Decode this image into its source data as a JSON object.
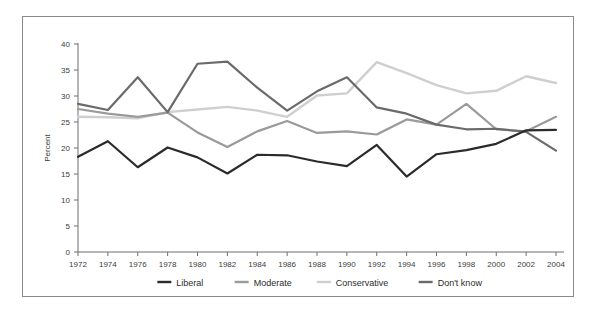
{
  "chart_data": {
    "type": "line",
    "title": "",
    "subtitle": "",
    "xlabel": "",
    "ylabel": "Percent",
    "xlim": [
      1972,
      2004
    ],
    "ylim": [
      0,
      40
    ],
    "ytick_step": 5,
    "xtick_step": 2,
    "grid": false,
    "legend_position": "bottom",
    "x": [
      1972,
      1974,
      1976,
      1978,
      1980,
      1982,
      1984,
      1986,
      1988,
      1990,
      1992,
      1994,
      1996,
      1998,
      2000,
      2002,
      2004
    ],
    "xticklabels": [
      "1972",
      "1974",
      "1976",
      "1978",
      "1980",
      "1982",
      "1984",
      "1986",
      "1988",
      "1990",
      "1992",
      "1994",
      "1996",
      "1998",
      "2000",
      "2002",
      "2004"
    ],
    "yticklabels": [
      "0",
      "5",
      "10",
      "15",
      "20",
      "25",
      "30",
      "35",
      "40"
    ],
    "yticks": [
      0,
      5,
      10,
      15,
      20,
      25,
      30,
      35,
      40
    ],
    "series": [
      {
        "name": "Liberal",
        "color": "#2b2b2b",
        "width": 2.2,
        "values": [
          18.3,
          21.3,
          16.3,
          20.1,
          18.2,
          15.1,
          18.7,
          18.6,
          17.4,
          16.5,
          20.6,
          14.5,
          18.8,
          19.6,
          20.8,
          23.4,
          23.5
        ]
      },
      {
        "name": "Moderate",
        "color": "#9a9a9a",
        "width": 2.2,
        "values": [
          27.5,
          26.6,
          26.0,
          26.8,
          23.0,
          20.2,
          23.2,
          25.2,
          22.9,
          23.2,
          22.6,
          25.5,
          24.5,
          28.5,
          23.6,
          23.2,
          26.0
        ]
      },
      {
        "name": "Conservative",
        "color": "#cfcfcf",
        "width": 2.4,
        "values": [
          26.0,
          25.9,
          25.7,
          26.9,
          27.4,
          27.9,
          27.2,
          26.0,
          30.1,
          30.5,
          36.5,
          34.4,
          32.1,
          30.5,
          31.0,
          33.8,
          32.5
        ]
      },
      {
        "name": "Don't know",
        "color": "#6a6a6a",
        "width": 2.2,
        "values": [
          28.5,
          27.3,
          33.6,
          26.9,
          36.2,
          36.6,
          31.6,
          27.2,
          30.9,
          33.6,
          27.8,
          26.6,
          24.5,
          23.6,
          23.7,
          23.1,
          19.5
        ]
      }
    ]
  },
  "legend": {
    "items": [
      {
        "label": "Liberal",
        "color": "#2b2b2b"
      },
      {
        "label": "Moderate",
        "color": "#9a9a9a"
      },
      {
        "label": "Conservative",
        "color": "#cfcfcf"
      },
      {
        "label": "Don't know",
        "color": "#6a6a6a"
      }
    ]
  },
  "axes": {
    "y_axis_title": "Percent"
  }
}
